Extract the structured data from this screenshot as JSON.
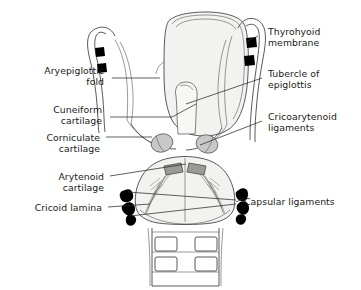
{
  "figure": {
    "view": "posterior",
    "background_color": "#ffffff",
    "line_color": "#3c3c3c",
    "label_color": "#1a1a1a",
    "marker_color": "#000000",
    "cartilage_fill": "#f2f2f0",
    "corniculate_fill": "#c8c8c6",
    "arytenoid_fill": "#9a9a98"
  },
  "labels_left": [
    {
      "id": "aryepiglottic-fold",
      "lines": [
        "Aryepiglottic",
        "fold"
      ]
    },
    {
      "id": "cuneiform-cartilage",
      "lines": [
        "Cuneiform",
        "cartilage"
      ]
    },
    {
      "id": "corniculate-cartilage",
      "lines": [
        "Corniculate",
        "cartilage"
      ]
    },
    {
      "id": "arytenoid-cartilage",
      "lines": [
        "Arytenoid",
        "cartilage"
      ]
    },
    {
      "id": "cricoid-lamina",
      "lines": [
        "Cricoid lamina"
      ]
    }
  ],
  "labels_right": [
    {
      "id": "thyrohyoid-membrane",
      "lines": [
        "Thyrohyoid",
        "membrane"
      ]
    },
    {
      "id": "tubercle-of-epiglottis",
      "lines": [
        "Tubercle of",
        "epiglottis"
      ]
    },
    {
      "id": "cricoarytenoid-ligaments",
      "lines": [
        "Cricoarytenoid",
        "ligaments"
      ]
    },
    {
      "id": "capsular-ligaments",
      "lines": [
        "Capsular ligaments"
      ]
    }
  ],
  "structures": [
    {
      "id": "thyroid-cartilage-lamina",
      "name": "Thyroid cartilage lamina"
    },
    {
      "id": "superior-horn-left",
      "name": "Left superior horn"
    },
    {
      "id": "superior-horn-right",
      "name": "Right superior horn"
    },
    {
      "id": "epiglottis",
      "name": "Epiglottis"
    },
    {
      "id": "corniculate-left",
      "name": "Left corniculate cartilage"
    },
    {
      "id": "corniculate-right",
      "name": "Right corniculate cartilage"
    },
    {
      "id": "arytenoid-left",
      "name": "Left arytenoid cartilage"
    },
    {
      "id": "arytenoid-right",
      "name": "Right arytenoid cartilage"
    },
    {
      "id": "cricoid-lamina-body",
      "name": "Cricoid lamina"
    },
    {
      "id": "trachea",
      "name": "Trachea with tracheal rings"
    }
  ]
}
